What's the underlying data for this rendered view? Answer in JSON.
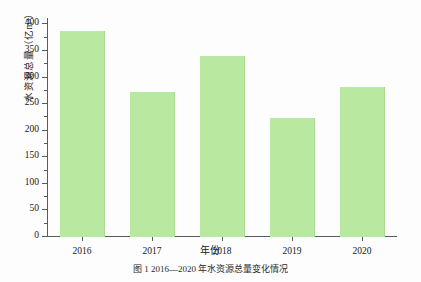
{
  "chart_data": {
    "type": "bar",
    "title": "",
    "categories": [
      "2016",
      "2017",
      "2018",
      "2019",
      "2020"
    ],
    "values": [
      387,
      272,
      340,
      223,
      283
    ],
    "series": [
      {
        "name": "水资源总量",
        "values": [
          387,
          272,
          340,
          223,
          283
        ]
      }
    ],
    "xlabel": "年份",
    "ylabel": "水资源总量（亿m³）",
    "ylim": [
      0,
      412
    ],
    "yticks": [
      0,
      50,
      100,
      150,
      200,
      250,
      300,
      350,
      400
    ],
    "ytick_labels": [
      "0",
      "50",
      "100",
      "150",
      "200",
      "250",
      "300",
      "350",
      "400"
    ],
    "minor_yticks": [
      25,
      75,
      125,
      175,
      225,
      275,
      325,
      375
    ],
    "grid": false,
    "legend": false,
    "bar_color": "#b9e9a0",
    "axis_color": "#555b5e",
    "background": "#fdfdfd"
  },
  "caption": "图 1 2016—2020 年水资源总量变化情况"
}
